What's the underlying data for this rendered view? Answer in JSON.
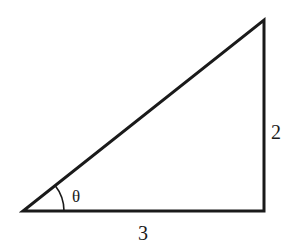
{
  "diagram": {
    "type": "right-triangle",
    "labels": {
      "adjacent": "3",
      "opposite": "2",
      "angle": "θ"
    },
    "colors": {
      "stroke": "#1a1a1a",
      "background": "#ffffff"
    }
  }
}
